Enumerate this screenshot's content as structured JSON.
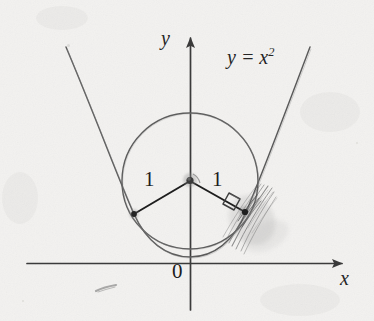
{
  "figure": {
    "medium": "scanned pencil-and-ink textbook diagram",
    "background_color": "#f3f2f0",
    "ink_color": "#2b2b2b",
    "curve_color": "#555555",
    "pencil_color": "#6e6e6e",
    "width": 374,
    "height": 321
  },
  "axes": {
    "x_axis": {
      "label": "x",
      "label_x": 345,
      "label_y": 277,
      "start_x": 27,
      "end_x": 347,
      "y": 263,
      "arrow": "right"
    },
    "y_axis": {
      "label": "y",
      "label_x": 168,
      "label_y": 38,
      "x": 190,
      "start_y": 310,
      "end_y": 33,
      "arrow": "up"
    },
    "origin": {
      "label": "0",
      "label_x": 178,
      "label_y": 270,
      "x": 190,
      "y": 263
    }
  },
  "curves": {
    "parabola": {
      "equation_label": "y = x",
      "equation_exponent": "2",
      "equation_label_x": 228,
      "equation_label_y": 57,
      "vertex_x": 190,
      "vertex_y": 257,
      "left_tip_x": 66,
      "left_tip_y": 47,
      "right_tip_x": 310,
      "right_tip_y": 47
    },
    "circle": {
      "center_x": 190,
      "center_y": 181,
      "radius": 68,
      "top_y": 113,
      "bottom_y": 249,
      "left_x": 122,
      "right_x": 258
    }
  },
  "points": {
    "center": {
      "name": "circle-center",
      "x": 190,
      "y": 181
    },
    "tangent_left": {
      "name": "left-tangency-point",
      "x": 134,
      "y": 214
    },
    "tangent_right": {
      "name": "right-tangency-point",
      "x": 244,
      "y": 212
    }
  },
  "radii": [
    {
      "label": "1",
      "label_x": 150,
      "label_y": 180,
      "from_x": 190,
      "from_y": 181,
      "to_x": 134,
      "to_y": 214
    },
    {
      "label": "1",
      "label_x": 218,
      "label_y": 180,
      "from_x": 190,
      "from_y": 181,
      "to_x": 244,
      "to_y": 212
    }
  ],
  "annotations": {
    "right_angle_marker": {
      "name": "right-angle-square",
      "x": 232,
      "y": 197,
      "size": 13
    },
    "pencil_scribble": {
      "name": "pencil-shading-scribble",
      "center_x": 250,
      "center_y": 215,
      "description": "hand-drawn graphite strokes and smudge at the right tangency point"
    },
    "stray_mark": {
      "name": "stray-pencil-mark",
      "x": 104,
      "y": 289
    }
  }
}
